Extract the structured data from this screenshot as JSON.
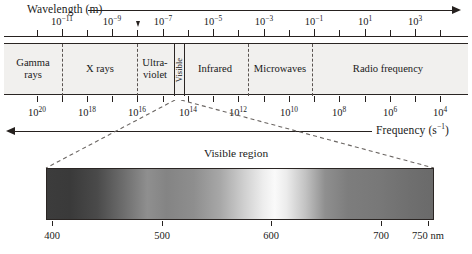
{
  "figure": {
    "type": "electromagnetic-spectrum-diagram"
  },
  "wavelength_axis": {
    "title": "Wavelength (m)",
    "unit": "m",
    "arrow_direction": "right",
    "labels": [
      {
        "text": "10",
        "exp": "−11",
        "x": 62
      },
      {
        "text": "10",
        "exp": "−9",
        "x": 112
      },
      {
        "text": "10",
        "exp": "−7",
        "x": 163
      },
      {
        "text": "10",
        "exp": "−5",
        "x": 213
      },
      {
        "text": "10",
        "exp": "−3",
        "x": 264
      },
      {
        "text": "10",
        "exp": "−1",
        "x": 314
      },
      {
        "text": "10",
        "exp": "1",
        "x": 365
      },
      {
        "text": "10",
        "exp": "3",
        "x": 415
      }
    ],
    "tick_x": [
      37,
      62,
      87,
      112,
      137,
      163,
      188,
      213,
      238,
      264,
      289,
      314,
      339,
      365,
      390,
      415,
      440
    ],
    "major_tick_x": [
      62,
      112,
      163,
      213,
      264,
      314,
      365,
      415
    ]
  },
  "frequency_axis": {
    "title": "Frequency (s",
    "title_exp": "−1",
    "title_tail": ")",
    "arrow_direction": "left",
    "labels": [
      {
        "text": "10",
        "exp": "20",
        "x": 37
      },
      {
        "text": "10",
        "exp": "18",
        "x": 87
      },
      {
        "text": "10",
        "exp": "16",
        "x": 137
      },
      {
        "text": "10",
        "exp": "14",
        "x": 188
      },
      {
        "text": "10",
        "exp": "12",
        "x": 238
      },
      {
        "text": "10",
        "exp": "10",
        "x": 289
      },
      {
        "text": "10",
        "exp": "8",
        "x": 339
      },
      {
        "text": "10",
        "exp": "6",
        "x": 390
      },
      {
        "text": "10",
        "exp": "4",
        "x": 440
      }
    ],
    "tick_x": [
      37,
      62,
      87,
      112,
      137,
      163,
      188,
      213,
      238,
      264,
      289,
      314,
      339,
      365,
      390,
      415,
      440
    ]
  },
  "bands": [
    {
      "name": "gamma-rays",
      "line1": "Gamma",
      "line2": "rays",
      "center": 33,
      "two_line": true
    },
    {
      "name": "x-rays",
      "line1": "X rays",
      "line2": "",
      "center": 100,
      "two_line": false
    },
    {
      "name": "ultraviolet",
      "line1": "Ultra-",
      "line2": "violet",
      "center": 155,
      "two_line": true
    },
    {
      "name": "visible",
      "line1": "Visible",
      "line2": "",
      "center": 176,
      "two_line": false
    },
    {
      "name": "infrared",
      "line1": "Infrared",
      "line2": "",
      "center": 215,
      "two_line": false
    },
    {
      "name": "microwaves",
      "line1": "Microwaves",
      "line2": "",
      "center": 280,
      "two_line": false
    },
    {
      "name": "radio-frequency",
      "line1": "Radio frequency",
      "line2": "",
      "center": 388,
      "two_line": false
    }
  ],
  "band_divider_x": [
    62,
    137,
    248,
    312
  ],
  "visible_slice": {
    "left": 170,
    "width": 11,
    "label": "Visible"
  },
  "callout": {
    "title": "Visible region"
  },
  "visible_spectrum": {
    "left_nm": 400,
    "right_nm": 750,
    "unit": "nm",
    "ticks": [
      {
        "value": "400",
        "x": 52
      },
      {
        "value": "500",
        "x": 162
      },
      {
        "value": "600",
        "x": 271
      },
      {
        "value": "700",
        "x": 381
      },
      {
        "value": "750 nm",
        "x": 428
      }
    ]
  },
  "colors": {
    "ink": "#26211f",
    "strip_fill": "#f1f0ee",
    "divider": "#5a5350",
    "callout_dash": "#6b6663"
  }
}
